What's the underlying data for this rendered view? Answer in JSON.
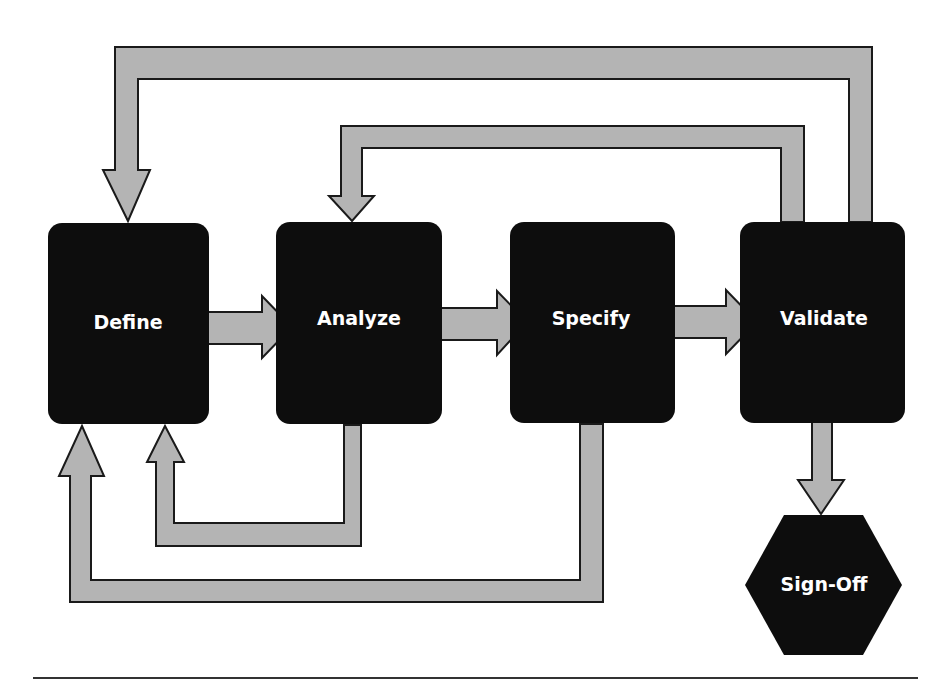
{
  "diagram": {
    "type": "process-flow",
    "colors": {
      "node_fill": "#0d0d0d",
      "node_text": "#ffffff",
      "arrow_fill": "#b4b4b4",
      "arrow_stroke": "#1a1a1a",
      "background": "#ffffff"
    },
    "nodes": [
      {
        "id": "define",
        "label": "Define",
        "shape": "rounded-rect"
      },
      {
        "id": "analyze",
        "label": "Analyze",
        "shape": "rounded-rect"
      },
      {
        "id": "specify",
        "label": "Specify",
        "shape": "rounded-rect"
      },
      {
        "id": "validate",
        "label": "Validate",
        "shape": "rounded-rect"
      },
      {
        "id": "signoff",
        "label": "Sign-Off",
        "shape": "hexagon"
      }
    ],
    "edges": [
      {
        "from": "define",
        "to": "analyze",
        "kind": "forward"
      },
      {
        "from": "analyze",
        "to": "specify",
        "kind": "forward"
      },
      {
        "from": "specify",
        "to": "validate",
        "kind": "forward"
      },
      {
        "from": "validate",
        "to": "signoff",
        "kind": "forward"
      },
      {
        "from": "analyze",
        "to": "define",
        "kind": "feedback"
      },
      {
        "from": "specify",
        "to": "define",
        "kind": "feedback"
      },
      {
        "from": "validate",
        "to": "analyze",
        "kind": "feedback"
      },
      {
        "from": "validate",
        "to": "define",
        "kind": "feedback"
      }
    ]
  }
}
